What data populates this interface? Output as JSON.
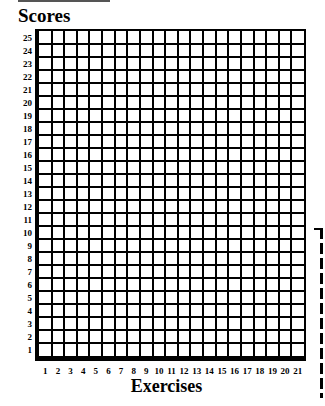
{
  "chart_data": {
    "type": "table",
    "title": "Scores",
    "xlabel": "Exercises",
    "ylabel": "Scores",
    "x_ticks": [
      "1",
      "2",
      "3",
      "4",
      "5",
      "6",
      "7",
      "8",
      "9",
      "10",
      "11",
      "12",
      "13",
      "14",
      "15",
      "16",
      "17",
      "18",
      "19",
      "20",
      "21"
    ],
    "y_ticks": [
      "1",
      "2",
      "3",
      "4",
      "5",
      "6",
      "7",
      "8",
      "9",
      "10",
      "11",
      "12",
      "13",
      "14",
      "15",
      "16",
      "17",
      "18",
      "19",
      "20",
      "21",
      "22",
      "23",
      "24",
      "25"
    ],
    "columns": 21,
    "rows": 25,
    "grid": true,
    "values": []
  },
  "page": {
    "title": "Scores",
    "x_axis_title": "Exercises"
  }
}
